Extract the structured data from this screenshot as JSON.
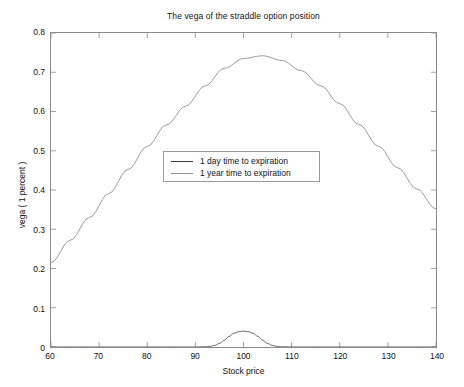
{
  "chart_data": {
    "type": "line",
    "title": "The vega of the straddle option position",
    "xlabel": "Stock price",
    "ylabel": "vega ( 1 percent )",
    "xlim": [
      60,
      140
    ],
    "ylim": [
      0,
      0.8
    ],
    "xticks": [
      60,
      70,
      80,
      90,
      100,
      110,
      120,
      130,
      140
    ],
    "xticklabels": [
      "60",
      "70",
      "80",
      "90",
      "100",
      "110",
      "120",
      "130",
      "140"
    ],
    "yticks": [
      0,
      0.1,
      0.2,
      0.3,
      0.4,
      0.5,
      0.6,
      0.7,
      0.8
    ],
    "yticklabels": [
      "0",
      "0.1",
      "0.2",
      "0.3",
      "0.4",
      "0.5",
      "0.6",
      "0.7",
      "0.8"
    ],
    "grid": false,
    "legend_position": "center",
    "series": [
      {
        "name": "1 day time to expiration",
        "color": "#3a3a3a",
        "x": [
          60,
          64,
          68,
          72,
          76,
          80,
          84,
          88,
          90,
          92,
          93,
          94,
          95,
          96,
          97,
          98,
          99,
          100,
          101,
          102,
          103,
          104,
          105,
          106,
          107,
          108,
          110,
          112,
          116,
          120,
          124,
          128,
          132,
          136,
          140
        ],
        "y": [
          0.0,
          0.0,
          0.0,
          0.0,
          0.0,
          0.0,
          0.0,
          0.0,
          0.0,
          0.0005,
          0.0015,
          0.004,
          0.009,
          0.017,
          0.027,
          0.035,
          0.039,
          0.0405,
          0.039,
          0.035,
          0.027,
          0.017,
          0.009,
          0.004,
          0.0015,
          0.0005,
          0.0,
          0.0,
          0.0,
          0.0,
          0.0,
          0.0,
          0.0,
          0.0,
          0.0
        ]
      },
      {
        "name": "1 year time to expiration",
        "color": "#808080",
        "x": [
          60,
          64,
          68,
          72,
          76,
          80,
          84,
          88,
          92,
          96,
          100,
          104,
          108,
          112,
          116,
          120,
          124,
          128,
          132,
          136,
          140
        ],
        "y": [
          0.215,
          0.272,
          0.33,
          0.391,
          0.452,
          0.511,
          0.566,
          0.614,
          0.665,
          0.71,
          0.735,
          0.742,
          0.73,
          0.704,
          0.666,
          0.62,
          0.567,
          0.512,
          0.457,
          0.403,
          0.352
        ]
      }
    ]
  },
  "legend": {
    "items": [
      {
        "label": "1 day time to expiration",
        "color": "#3a3a3a"
      },
      {
        "label": "1 year time to expiration",
        "color": "#909090"
      }
    ]
  },
  "colors": {
    "background": "#ffffff",
    "axis": "#8a8a8a",
    "text": "#111111"
  }
}
